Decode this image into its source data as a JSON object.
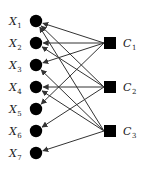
{
  "diagram": {
    "type": "bipartite-graph",
    "left_nodes": [
      {
        "id": "X1",
        "base": "X",
        "sub": "1",
        "y": 21
      },
      {
        "id": "X2",
        "base": "X",
        "sub": "2",
        "y": 43
      },
      {
        "id": "X3",
        "base": "X",
        "sub": "3",
        "y": 65
      },
      {
        "id": "X4",
        "base": "X",
        "sub": "4",
        "y": 87
      },
      {
        "id": "X5",
        "base": "X",
        "sub": "5",
        "y": 109
      },
      {
        "id": "X6",
        "base": "X",
        "sub": "6",
        "y": 131
      },
      {
        "id": "X7",
        "base": "X",
        "sub": "7",
        "y": 153
      }
    ],
    "right_nodes": [
      {
        "id": "C1",
        "base": "C",
        "sub": "1",
        "y": 43
      },
      {
        "id": "C2",
        "base": "C",
        "sub": "2",
        "y": 87
      },
      {
        "id": "C3",
        "base": "C",
        "sub": "3",
        "y": 131
      }
    ],
    "edges": [
      {
        "from": "C1",
        "to": "X1"
      },
      {
        "from": "C1",
        "to": "X2"
      },
      {
        "from": "C1",
        "to": "X3"
      },
      {
        "from": "C1",
        "to": "X5"
      },
      {
        "from": "C2",
        "to": "X1"
      },
      {
        "from": "C2",
        "to": "X2"
      },
      {
        "from": "C2",
        "to": "X4"
      },
      {
        "from": "C2",
        "to": "X6"
      },
      {
        "from": "C3",
        "to": "X1"
      },
      {
        "from": "C3",
        "to": "X3"
      },
      {
        "from": "C3",
        "to": "X4"
      },
      {
        "from": "C3",
        "to": "X7"
      }
    ],
    "colors": {
      "node": "#000000",
      "edge": "#333333",
      "label": "#222222"
    }
  }
}
